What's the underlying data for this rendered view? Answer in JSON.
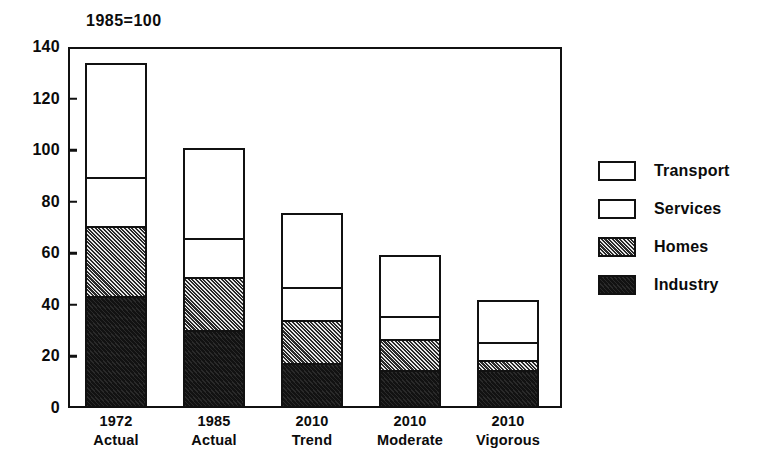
{
  "chart_data": {
    "type": "bar",
    "subtype": "stacked-bar",
    "title": "1985=100",
    "xlabel": "",
    "ylabel": "",
    "ylim": [
      0,
      140
    ],
    "y_ticks": [
      0,
      20,
      40,
      60,
      80,
      100,
      120,
      140
    ],
    "grid": false,
    "legend_position": "right",
    "categories": [
      "1972\nActual",
      "1985\nActual",
      "2010\nTrend",
      "2010\nModerate",
      "2010\nVigorous"
    ],
    "category_lines": [
      {
        "line1": "1972",
        "line2": "Actual"
      },
      {
        "line1": "1985",
        "line2": "Actual"
      },
      {
        "line1": "2010",
        "line2": "Trend"
      },
      {
        "line1": "2010",
        "line2": "Moderate"
      },
      {
        "line1": "2010",
        "line2": "Vigorous"
      }
    ],
    "series": [
      {
        "name": "Industry",
        "pattern": "solid-black",
        "values": [
          42.5,
          29.5,
          16.5,
          14.0,
          14.0
        ]
      },
      {
        "name": "Homes",
        "pattern": "diagonal-hatch",
        "values": [
          27.5,
          20.5,
          17.0,
          12.0,
          4.0
        ]
      },
      {
        "name": "Services",
        "pattern": "white-outline",
        "values": [
          19.0,
          15.0,
          12.5,
          9.0,
          7.0
        ]
      },
      {
        "name": "Transport",
        "pattern": "white-outline",
        "values": [
          44.0,
          35.0,
          29.0,
          23.5,
          16.0
        ]
      }
    ],
    "totals": [
      133.0,
      100.0,
      75.0,
      58.5,
      41.0
    ],
    "stack_tops": {
      "1972 Actual": {
        "industry": 42.5,
        "homes": 70.0,
        "services": 89.0,
        "transport": 133.0
      },
      "1985 Actual": {
        "industry": 29.5,
        "homes": 50.0,
        "services": 65.0,
        "transport": 100.0
      },
      "2010 Trend": {
        "industry": 16.5,
        "homes": 33.5,
        "services": 46.0,
        "transport": 75.0
      },
      "2010 Moderate": {
        "industry": 14.0,
        "homes": 26.0,
        "services": 35.0,
        "transport": 58.5
      },
      "2010 Vigorous": {
        "industry": 14.0,
        "homes": 18.0,
        "services": 25.0,
        "transport": 41.0
      }
    }
  },
  "legend": {
    "items": [
      {
        "label": "Transport",
        "pattern": "white"
      },
      {
        "label": "Services",
        "pattern": "white"
      },
      {
        "label": "Homes",
        "pattern": "hatch"
      },
      {
        "label": "Industry",
        "pattern": "black"
      }
    ]
  },
  "colors": {
    "ink": "#111111",
    "fill_white": "#ffffff",
    "fill_black": "#121212",
    "hatch_dark": "#2a2a2a",
    "hatch_light": "#e9e9e9",
    "background": "#ffffff"
  },
  "axis": {
    "y_tick_labels": [
      "140",
      "120",
      "100",
      "80",
      "60",
      "40",
      "20",
      "0"
    ]
  }
}
